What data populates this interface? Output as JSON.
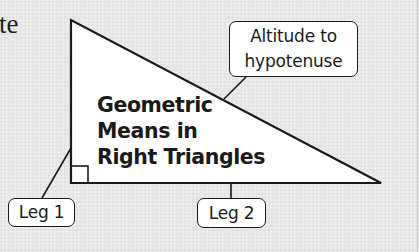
{
  "partial_text": "te",
  "title": {
    "lines": [
      "Geometric",
      "Means in",
      "Right Triangles"
    ]
  },
  "callouts": {
    "altitude": {
      "lines": [
        "Altitude to",
        "hypotenuse"
      ]
    },
    "leg1": {
      "label": "Leg 1"
    },
    "leg2": {
      "label": "Leg 2"
    }
  },
  "colors": {
    "background": "#e6e6e6",
    "triangle_fill": "#ffffff",
    "stroke": "#1a1a1a"
  }
}
